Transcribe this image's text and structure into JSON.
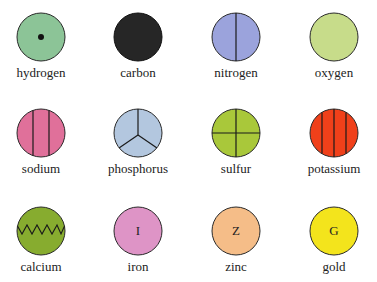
{
  "elements": [
    {
      "name": "hydrogen",
      "color": "#8cc497",
      "mark": "dot",
      "letter": ""
    },
    {
      "name": "carbon",
      "color": "#262626",
      "mark": "none",
      "letter": ""
    },
    {
      "name": "nitrogen",
      "color": "#9ba3dc",
      "mark": "vline1",
      "letter": ""
    },
    {
      "name": "oxygen",
      "color": "#c7dc8a",
      "mark": "none",
      "letter": ""
    },
    {
      "name": "sodium",
      "color": "#e0709a",
      "mark": "vline2",
      "letter": ""
    },
    {
      "name": "phosphorus",
      "color": "#b3c7df",
      "mark": "peace",
      "letter": ""
    },
    {
      "name": "sulfur",
      "color": "#a9c83a",
      "mark": "cross",
      "letter": ""
    },
    {
      "name": "potassium",
      "color": "#f0401a",
      "mark": "vline3",
      "letter": ""
    },
    {
      "name": "calcium",
      "color": "#87ac2f",
      "mark": "zigzag",
      "letter": ""
    },
    {
      "name": "iron",
      "color": "#de94c6",
      "mark": "letter",
      "letter": "I"
    },
    {
      "name": "zinc",
      "color": "#f5bd88",
      "mark": "letter",
      "letter": "Z"
    },
    {
      "name": "gold",
      "color": "#f3e41c",
      "mark": "letter",
      "letter": "G"
    }
  ]
}
